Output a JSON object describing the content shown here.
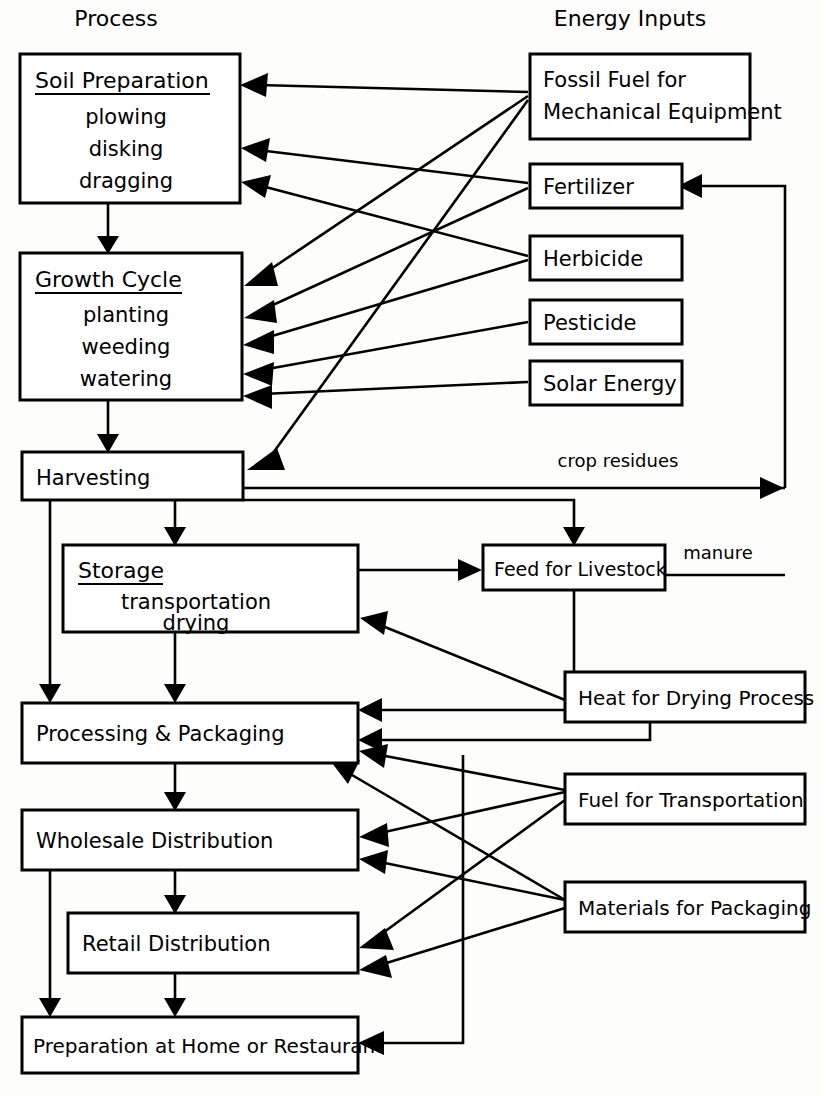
{
  "diagram": {
    "columns": {
      "left_header": "Process",
      "right_header": "Energy Inputs"
    },
    "process_boxes": [
      {
        "id": "soil-preparation",
        "title": "Soil Preparation",
        "underlined": true,
        "items": [
          "plowing",
          "disking",
          "dragging"
        ]
      },
      {
        "id": "growth-cycle",
        "title": "Growth Cycle",
        "underlined": true,
        "items": [
          "planting",
          "weeding",
          "watering"
        ]
      },
      {
        "id": "harvesting",
        "title": "Harvesting",
        "underlined": false,
        "items": []
      },
      {
        "id": "storage",
        "title": "Storage",
        "underlined": true,
        "items": [
          "transportation",
          "drying"
        ]
      },
      {
        "id": "processing-packaging",
        "title": "Processing & Packaging",
        "underlined": false,
        "items": []
      },
      {
        "id": "wholesale-distribution",
        "title": "Wholesale Distribution",
        "underlined": false,
        "items": []
      },
      {
        "id": "retail-distribution",
        "title": "Retail Distribution",
        "underlined": false,
        "items": []
      },
      {
        "id": "preparation-home-restaurant",
        "title": "Preparation at Home or Restaurant",
        "underlined": false,
        "items": []
      }
    ],
    "input_boxes": [
      {
        "id": "fossil-fuel",
        "line1": "Fossil Fuel for",
        "line2": "Mechanical Equipment"
      },
      {
        "id": "fertilizer",
        "label": "Fertilizer"
      },
      {
        "id": "herbicide",
        "label": "Herbicide"
      },
      {
        "id": "pesticide",
        "label": "Pesticide"
      },
      {
        "id": "solar-energy",
        "label": "Solar Energy"
      },
      {
        "id": "feed-for-livestock",
        "label": "Feed for Livestock"
      },
      {
        "id": "heat-for-drying",
        "label": "Heat for Drying Process"
      },
      {
        "id": "fuel-for-transportation",
        "label": "Fuel for Transportation"
      },
      {
        "id": "materials-for-packaging",
        "label": "Materials for Packaging"
      }
    ],
    "edge_labels": [
      {
        "id": "crop-residues",
        "text": "crop residues"
      },
      {
        "id": "manure",
        "text": "manure"
      }
    ],
    "colors": {
      "stroke": "#000000",
      "box_fill": "#ffffff",
      "background": "#fdfdfb"
    }
  }
}
